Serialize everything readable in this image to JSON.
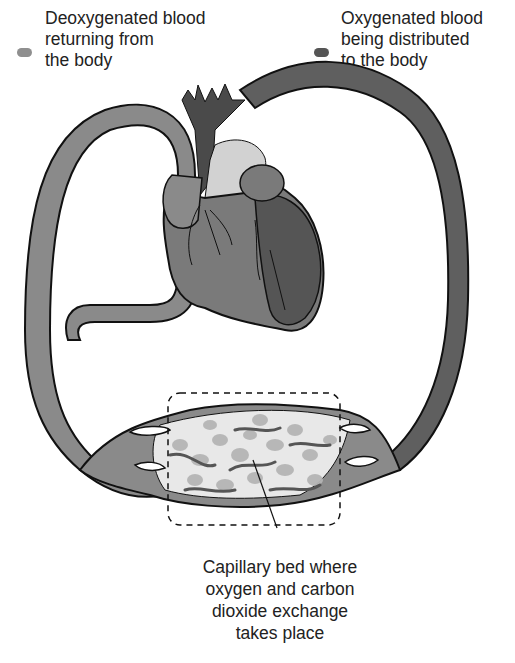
{
  "legend": {
    "deoxygenated": {
      "label": "Deoxygenated blood\nreturning from\nthe body",
      "color": "#8f8f8f",
      "icon": "light-gray-swatch-icon"
    },
    "oxygenated": {
      "label": "Oxygenated blood\nbeing distributed\nto the body",
      "color": "#555555",
      "icon": "dark-gray-swatch-icon"
    }
  },
  "diagram": {
    "parts": [
      "heart",
      "aorta",
      "vena-cava",
      "pulmonary-artery",
      "capillary-bed"
    ],
    "colors": {
      "deoxygenated_vessel": "#8a8a8a",
      "oxygenated_vessel": "#5f5f5f",
      "heart_body": "#7a7a7a",
      "left_ventricle": "#555555",
      "pulmonary_trunk": "#d2d2d2",
      "outline": "#111111",
      "capillary_cells": "#b5b5b5"
    }
  },
  "caption": {
    "text": "Capillary bed where\noxygen and carbon\ndioxide exchange\ntakes place"
  }
}
